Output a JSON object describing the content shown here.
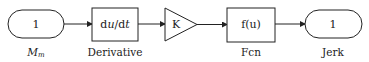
{
  "diagram": {
    "type": "simulink-block-diagram",
    "blocks": [
      {
        "id": "inport",
        "kind": "inport",
        "content": "1",
        "label_main": "M",
        "label_sub": "m"
      },
      {
        "id": "derivative",
        "kind": "derivative",
        "content_pre": "d",
        "content_u": "u",
        "content_post": "/d",
        "content_t": "t",
        "label": "Derivative"
      },
      {
        "id": "gain",
        "kind": "gain",
        "content": "K",
        "label": ""
      },
      {
        "id": "fcn",
        "kind": "fcn",
        "content": "f(u)",
        "label": "Fcn"
      },
      {
        "id": "outport",
        "kind": "outport",
        "content": "1",
        "label": "Jerk"
      }
    ],
    "connections": [
      {
        "from": "inport",
        "to": "derivative"
      },
      {
        "from": "derivative",
        "to": "gain"
      },
      {
        "from": "gain",
        "to": "fcn"
      },
      {
        "from": "fcn",
        "to": "outport"
      }
    ],
    "colors": {
      "stroke": "#222222",
      "background": "#ffffff"
    }
  }
}
